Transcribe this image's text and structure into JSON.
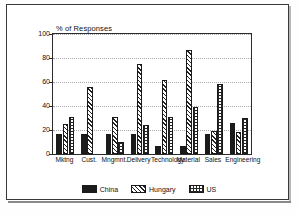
{
  "chart_data": {
    "type": "bar",
    "title": "",
    "xlabel": "",
    "ylabel": "% of Responses",
    "ylim": [
      0,
      100
    ],
    "yticks": [
      0,
      20,
      40,
      60,
      80,
      100
    ],
    "grid": true,
    "legend_position": "bottom",
    "categories": [
      "Mktng",
      "Cust.",
      "Mngmnt.",
      "Delivery",
      "Technology",
      "Material",
      "Sales",
      "Engineering"
    ],
    "series": [
      {
        "name": "China",
        "values": [
          17,
          17,
          17,
          17,
          7,
          7,
          17,
          26
        ],
        "fill": "solid-black",
        "color": "#1b1b1b"
      },
      {
        "name": "Hungary",
        "values": [
          25,
          56,
          31,
          75,
          62,
          87,
          19,
          18
        ],
        "fill": "diagonal-hatch",
        "color": "#222222"
      },
      {
        "name": "US",
        "values": [
          31,
          0,
          10,
          24,
          31,
          39,
          58,
          30
        ],
        "fill": "cross-grid",
        "color": "#262626"
      }
    ]
  },
  "axis": {
    "y_title": "% of Responses",
    "tick_labels": [
      "100",
      "80",
      "60",
      "40",
      "20",
      "0"
    ]
  },
  "legend": {
    "items": [
      {
        "label": "China"
      },
      {
        "label": "Hungary"
      },
      {
        "label": "US"
      }
    ]
  }
}
